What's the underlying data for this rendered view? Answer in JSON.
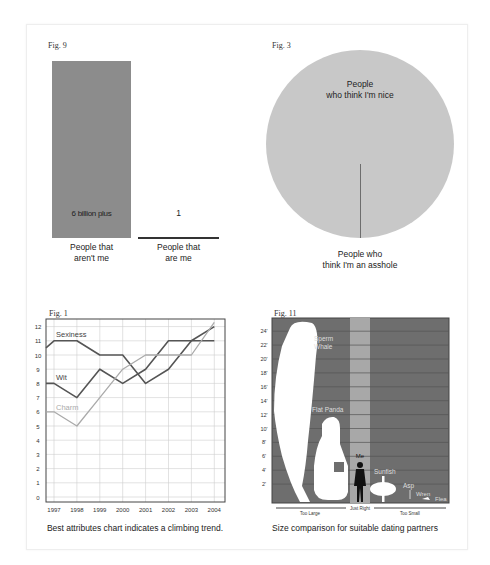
{
  "figures": {
    "fig9": {
      "label": "Fig. 9",
      "bar1_value": "6 billion plus",
      "bar1_label_line1": "People that",
      "bar1_label_line2": "aren't me",
      "bar2_value": "1",
      "bar2_label_line1": "People that",
      "bar2_label_line2": "are me",
      "bar_color": "#8c8c8c"
    },
    "fig3": {
      "label": "Fig. 3",
      "big_slice_line1": "People",
      "big_slice_line2": "who think I'm nice",
      "small_slice_line1": "People who",
      "small_slice_line2": "think I'm an asshole",
      "pie_color": "#c8c8c8"
    },
    "fig1": {
      "label": "Fig. 1",
      "caption": "Best attributes chart indicates a climbing trend.",
      "series_labels": {
        "sexiness": "Sexiness",
        "wit": "Wit",
        "charm": "Charm"
      },
      "y_ticks": [
        "0",
        "1",
        "2",
        "3",
        "4",
        "5",
        "6",
        "7",
        "8",
        "9",
        "10",
        "11",
        "12"
      ],
      "x_ticks": [
        "1997",
        "1998",
        "1999",
        "2000",
        "2001",
        "2002",
        "2003",
        "2004"
      ]
    },
    "fig11": {
      "label": "Fig. 11",
      "caption": "Size comparison for suitable dating partners",
      "y_ticks": [
        "2'",
        "4'",
        "6'",
        "8'",
        "10'",
        "12'",
        "14'",
        "16'",
        "18'",
        "20'",
        "22'",
        "24'"
      ],
      "items": {
        "whale": "Sperm Whale",
        "whale_l1": "Sperm",
        "whale_l2": "Whale",
        "panda": "Flat Panda",
        "me": "Me",
        "sunfish": "Sunfish",
        "asp": "Asp",
        "wren": "Wren",
        "flea": "Flea"
      },
      "zones": {
        "too_large": "Too Large",
        "just_right": "Just Right",
        "too_small": "Too Small"
      },
      "bg_color": "#6e6e6e",
      "band_color": "#a8a8a8"
    }
  },
  "chart_data": [
    {
      "type": "bar",
      "title": "Fig. 9",
      "categories": [
        "People that aren't me",
        "People that are me"
      ],
      "values": [
        6000000000,
        1
      ],
      "data_labels": [
        "6 billion plus",
        "1"
      ],
      "xlabel": "",
      "ylabel": "",
      "grid": false
    },
    {
      "type": "pie",
      "title": "Fig. 3",
      "categories": [
        "People who think I'm nice",
        "People who think I'm an asshole"
      ],
      "values": [
        99.9,
        0.1
      ],
      "legend": "inline labels"
    },
    {
      "type": "line",
      "title": "Fig. 1",
      "x": [
        "1997",
        "1998",
        "1999",
        "2000",
        "2001",
        "2002",
        "2003",
        "2004"
      ],
      "series": [
        {
          "name": "Sexiness",
          "values": [
            11,
            11,
            10,
            10,
            8,
            9,
            11,
            12
          ]
        },
        {
          "name": "Wit",
          "values": [
            8,
            7,
            9,
            8,
            9,
            11,
            11,
            11
          ]
        },
        {
          "name": "Charm",
          "values": [
            6,
            5,
            7,
            9,
            10,
            10,
            10,
            12.3
          ]
        }
      ],
      "ylim": [
        0,
        12
      ],
      "grid": true,
      "caption": "Best attributes chart indicates a climbing trend.",
      "legend": "inline labels"
    },
    {
      "type": "bar",
      "title": "Fig. 11",
      "subtitle": "Size comparison for suitable dating partners",
      "categories": [
        "Sperm Whale",
        "Flat Panda",
        "Me",
        "Sunfish",
        "Asp",
        "Wren",
        "Flea"
      ],
      "values": [
        25,
        11.5,
        6,
        4.5,
        2.5,
        0.5,
        0.1
      ],
      "ylabel": "Height (ft)",
      "ylim": [
        0,
        26
      ],
      "y_ticks": [
        "2'",
        "4'",
        "6'",
        "8'",
        "10'",
        "12'",
        "14'",
        "16'",
        "18'",
        "20'",
        "22'",
        "24'"
      ],
      "zones": [
        "Too Large",
        "Just Right",
        "Too Small"
      ],
      "grid": true
    }
  ]
}
